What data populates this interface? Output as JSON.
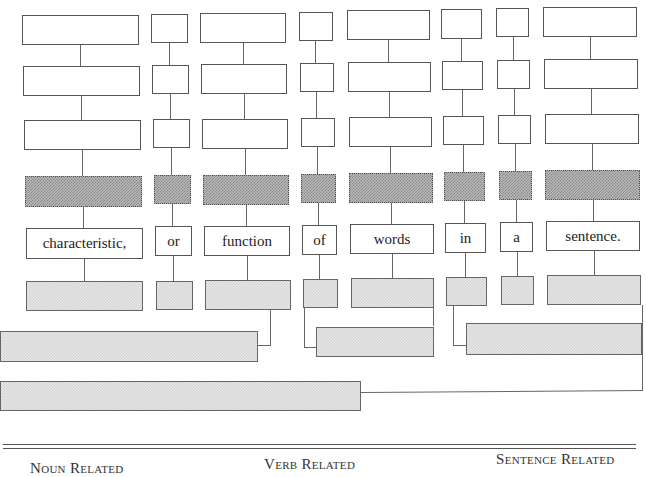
{
  "diagram": {
    "type": "sentence-diagram-worksheet",
    "words": [
      "characteristic,",
      "or",
      "function",
      "of",
      "words",
      "in",
      "a",
      "sentence."
    ],
    "rows": [
      "blank",
      "blank",
      "blank",
      "dark-shaded",
      "word",
      "light-shaded"
    ],
    "groupings": [
      {
        "name": "group-characteristic-or-function",
        "joins": [
          "function"
        ],
        "box": "wide-left"
      },
      {
        "name": "group-of-words",
        "joins": [
          "of",
          "words"
        ],
        "box": "middle"
      },
      {
        "name": "group-in-a-sentence",
        "joins": [
          "in",
          "sentence."
        ],
        "box": "right"
      },
      {
        "name": "group-final",
        "joins": [
          "middle",
          "right"
        ],
        "box": "bottom-left"
      }
    ]
  },
  "footer": {
    "labels": [
      "Noun Related",
      "Verb Related",
      "Sentence Related"
    ]
  },
  "colors": {
    "border": "#555555",
    "dark_shade": "#8a8a8a",
    "light_shade": "#e0e0e0",
    "text": "#222222"
  }
}
